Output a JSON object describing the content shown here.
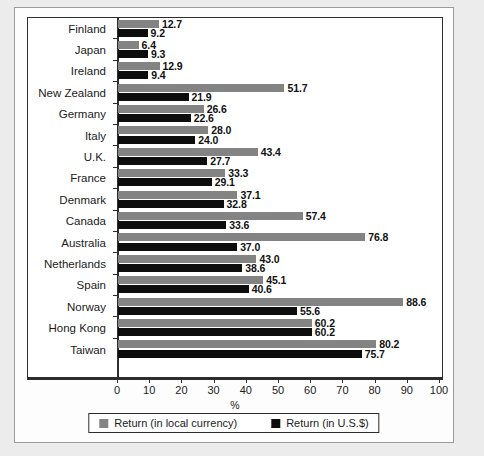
{
  "chart_data": {
    "type": "bar",
    "orientation": "horizontal",
    "title": "",
    "xlabel": "%",
    "ylabel": "",
    "xlim": [
      0,
      100
    ],
    "xticks": [
      0,
      10,
      20,
      30,
      40,
      50,
      60,
      70,
      80,
      90,
      100
    ],
    "grid": false,
    "legend_position": "bottom",
    "categories": [
      "Finland",
      "Japan",
      "Ireland",
      "New Zealand",
      "Germany",
      "Italy",
      "U.K.",
      "France",
      "Denmark",
      "Canada",
      "Australia",
      "Netherlands",
      "Spain",
      "Norway",
      "Hong Kong",
      "Taiwan"
    ],
    "series": [
      {
        "name": "Return (in local currency)",
        "color": "#838383",
        "values": [
          12.7,
          6.4,
          12.9,
          51.7,
          26.6,
          28.0,
          43.4,
          33.3,
          37.1,
          57.4,
          76.8,
          43.0,
          45.1,
          88.6,
          60.2,
          80.2
        ]
      },
      {
        "name": "Return (in U.S.$)",
        "color": "#0d0d0d",
        "values": [
          9.2,
          9.3,
          9.4,
          21.9,
          22.6,
          24.0,
          27.7,
          29.1,
          32.8,
          33.6,
          37.0,
          38.6,
          40.6,
          55.6,
          60.2,
          75.7
        ]
      }
    ]
  },
  "legend": {
    "items": [
      {
        "label": "Return (in local currency)",
        "swatch": "local"
      },
      {
        "label": "Return (in U.S.$)",
        "swatch": "usd"
      }
    ]
  },
  "axis": {
    "x_title": "%"
  },
  "colors": {
    "local_currency": "#838383",
    "us_dollar": "#0d0d0d",
    "panel_background": "#ffffff",
    "page_background": "#ececed",
    "axis": "#2d2d2d"
  }
}
